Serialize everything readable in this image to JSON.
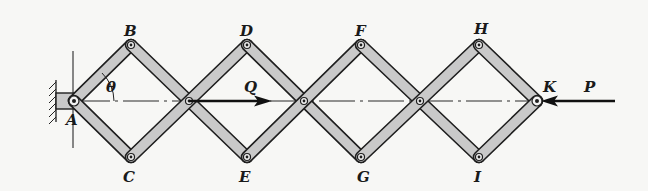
{
  "figure": {
    "type": "scissor-linkage mechanism (lazy-tongs)",
    "background": "#f7f7f5",
    "link_fill_color": "#c9c9c9",
    "outline_color": "#1e1e1e"
  },
  "labels": {
    "A": "A",
    "B": "B",
    "C": "C",
    "D": "D",
    "E": "E",
    "F": "F",
    "G": "G",
    "H": "H",
    "I": "I",
    "K": "K",
    "theta": "θ",
    "Q": "Q",
    "P": "P"
  },
  "joints": {
    "A": {
      "x": 74,
      "y": 101,
      "role": "fixed pin support"
    },
    "B": {
      "x": 131,
      "y": 45
    },
    "C": {
      "x": 131,
      "y": 157
    },
    "X1": {
      "x": 189,
      "y": 101,
      "role": "crossing pivot"
    },
    "D": {
      "x": 247,
      "y": 45
    },
    "E": {
      "x": 247,
      "y": 157
    },
    "X2": {
      "x": 304,
      "y": 101,
      "role": "crossing pivot"
    },
    "F": {
      "x": 361,
      "y": 45
    },
    "G": {
      "x": 361,
      "y": 157
    },
    "X3": {
      "x": 420,
      "y": 101,
      "role": "crossing pivot"
    },
    "H": {
      "x": 479,
      "y": 45
    },
    "I": {
      "x": 479,
      "y": 157
    },
    "K": {
      "x": 537,
      "y": 101,
      "role": "end pin"
    }
  },
  "forces": {
    "Q": {
      "direction": "right",
      "applied_at": "X1",
      "label": "Q"
    },
    "P": {
      "direction": "left",
      "applied_at": "K",
      "label": "P"
    }
  },
  "angle": {
    "symbol": "θ",
    "between": "link AB and horizontal centerline"
  }
}
